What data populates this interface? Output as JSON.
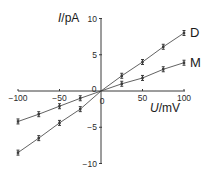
{
  "chart_data": {
    "type": "line",
    "title": "",
    "xlabel": "U/mV",
    "ylabel": "I/pA",
    "xlabel_italic_part": "U",
    "xlabel_unit": "/mV",
    "ylabel_italic_part": "I",
    "ylabel_unit": "/pA",
    "xlim": [
      -100,
      100
    ],
    "ylim": [
      -10,
      10
    ],
    "x_ticks": [
      -100,
      -50,
      50,
      100
    ],
    "y_ticks": [
      10,
      5,
      -5,
      -10
    ],
    "origin_labels": [
      "0",
      "0"
    ],
    "grid": false,
    "legend_position": "inline-right",
    "x": [
      -100,
      -75,
      -50,
      -25,
      0,
      25,
      50,
      75,
      100
    ],
    "series": [
      {
        "name": "D",
        "values": [
          -8.5,
          -6.5,
          -4.4,
          -2.5,
          0,
          2.1,
          4.0,
          6.1,
          8.0
        ],
        "error_bars": true
      },
      {
        "name": "M",
        "values": [
          -4.2,
          -3.2,
          -2.1,
          -1.0,
          0,
          1.0,
          1.8,
          3.0,
          3.9
        ],
        "error_bars": true
      }
    ]
  },
  "colors": {
    "line": "#3a3a3a",
    "text": "#1a1a1a"
  }
}
